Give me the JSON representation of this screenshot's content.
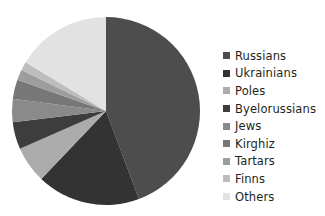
{
  "chart_data": {
    "type": "pie",
    "title": "",
    "subtitle": "",
    "xlabel": "",
    "ylabel": "",
    "grid": false,
    "legend_position": "right",
    "start_angle_deg": 0,
    "direction": "clockwise",
    "categories": [
      "Russians",
      "Ukrainians",
      "Poles",
      "Byelorussians",
      "Jews",
      "Kirghiz",
      "Tartars",
      "Finns",
      "Others"
    ],
    "values": [
      44.3,
      17.8,
      6.3,
      4.7,
      4.0,
      3.3,
      1.8,
      1.5,
      16.3
    ],
    "colors": [
      "#4d4d4d",
      "#333333",
      "#acacac",
      "#3d3d3d",
      "#8a8a8a",
      "#777777",
      "#9d9d9d",
      "#bdbdbd",
      "#e2e2e2"
    ],
    "series": [
      {
        "name": "Share",
        "values": [
          44.3,
          17.8,
          6.3,
          4.7,
          4.0,
          3.3,
          1.8,
          1.5,
          16.3
        ]
      }
    ]
  },
  "legend": {
    "items": [
      {
        "label": "Russians",
        "color": "#4d4d4d",
        "value": 44.3
      },
      {
        "label": "Ukrainians",
        "color": "#333333",
        "value": 17.8
      },
      {
        "label": "Poles",
        "color": "#acacac",
        "value": 6.3
      },
      {
        "label": "Byelorussians",
        "color": "#3d3d3d",
        "value": 4.7
      },
      {
        "label": "Jews",
        "color": "#8a8a8a",
        "value": 4.0
      },
      {
        "label": "Kirghiz",
        "color": "#777777",
        "value": 3.3
      },
      {
        "label": "Tartars",
        "color": "#9d9d9d",
        "value": 1.8
      },
      {
        "label": "Finns",
        "color": "#bdbdbd",
        "value": 1.5
      },
      {
        "label": "Others",
        "color": "#e2e2e2",
        "value": 16.3
      }
    ]
  },
  "figure": {
    "background": "#ffffff",
    "pie_center_x": 95,
    "pie_center_y": 95,
    "pie_radius": 94
  }
}
